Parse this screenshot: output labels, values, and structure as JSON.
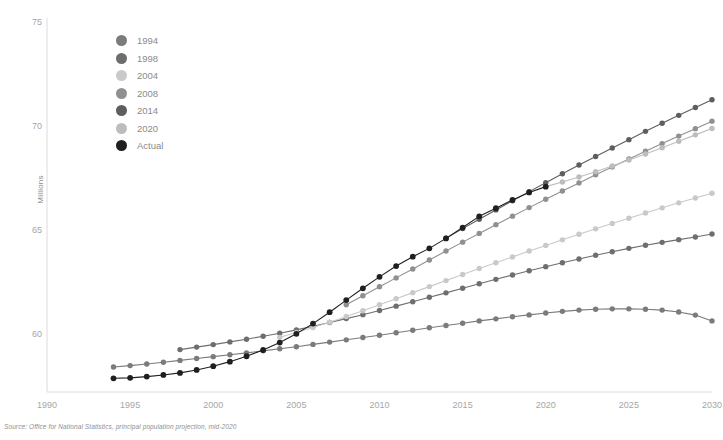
{
  "chart_data": {
    "type": "line",
    "title": "",
    "subtitle": "",
    "xlabel": "",
    "ylabel": "Millions",
    "xlim": [
      1990,
      2030
    ],
    "ylim": [
      57.2,
      75
    ],
    "grid": false,
    "legend_position": "top-left",
    "source_note": "Source: Office for National Statistics, principal population projection, mid-2020",
    "x_ticks": [
      1990,
      1995,
      2000,
      2005,
      2010,
      2015,
      2020,
      2025,
      2030
    ],
    "y_ticks": [
      60,
      65,
      70,
      75
    ],
    "series": [
      {
        "name": "1994",
        "color": "#7b7b7b",
        "x": [
          1994,
          1995,
          1996,
          1997,
          1998,
          1999,
          2000,
          2001,
          2002,
          2003,
          2004,
          2005,
          2006,
          2007,
          2008,
          2009,
          2010,
          2011,
          2012,
          2013,
          2014,
          2015,
          2016,
          2017,
          2018,
          2019,
          2020,
          2021,
          2022,
          2023,
          2024,
          2025,
          2026,
          2027,
          2028,
          2029,
          2030
        ],
        "values": [
          58.4,
          58.47,
          58.55,
          58.63,
          58.72,
          58.81,
          58.9,
          58.99,
          59.08,
          59.18,
          59.28,
          59.38,
          59.49,
          59.6,
          59.71,
          59.82,
          59.93,
          60.05,
          60.17,
          60.29,
          60.4,
          60.51,
          60.62,
          60.72,
          60.82,
          60.91,
          61.0,
          61.08,
          61.14,
          61.18,
          61.2,
          61.2,
          61.18,
          61.14,
          61.05,
          60.9,
          60.62
        ]
      },
      {
        "name": "1998",
        "color": "#6e6e6e",
        "x": [
          1998,
          1999,
          2000,
          2001,
          2002,
          2003,
          2004,
          2005,
          2006,
          2007,
          2008,
          2009,
          2010,
          2011,
          2012,
          2013,
          2014,
          2015,
          2016,
          2017,
          2018,
          2019,
          2020,
          2021,
          2022,
          2023,
          2024,
          2025,
          2026,
          2027,
          2028,
          2029,
          2030
        ],
        "values": [
          59.24,
          59.36,
          59.48,
          59.61,
          59.74,
          59.88,
          60.03,
          60.19,
          60.36,
          60.54,
          60.73,
          60.92,
          61.12,
          61.33,
          61.54,
          61.76,
          61.97,
          62.19,
          62.41,
          62.62,
          62.83,
          63.03,
          63.23,
          63.42,
          63.6,
          63.78,
          63.95,
          64.11,
          64.26,
          64.4,
          64.53,
          64.66,
          64.8
        ]
      },
      {
        "name": "2004",
        "color": "#c9c9c9",
        "x": [
          2004,
          2005,
          2006,
          2007,
          2008,
          2009,
          2010,
          2011,
          2012,
          2013,
          2014,
          2015,
          2016,
          2017,
          2018,
          2019,
          2020,
          2021,
          2022,
          2023,
          2024,
          2025,
          2026,
          2027,
          2028,
          2029,
          2030
        ],
        "values": [
          59.83,
          60.06,
          60.3,
          60.56,
          60.83,
          61.11,
          61.4,
          61.69,
          61.98,
          62.27,
          62.56,
          62.85,
          63.14,
          63.42,
          63.7,
          63.98,
          64.25,
          64.52,
          64.79,
          65.05,
          65.31,
          65.56,
          65.81,
          66.06,
          66.3,
          66.53,
          66.76
        ]
      },
      {
        "name": "2008",
        "color": "#909090",
        "x": [
          2008,
          2009,
          2010,
          2011,
          2012,
          2013,
          2014,
          2015,
          2016,
          2017,
          2018,
          2019,
          2020,
          2021,
          2022,
          2023,
          2024,
          2025,
          2026,
          2027,
          2028,
          2029,
          2030
        ],
        "values": [
          61.4,
          61.83,
          62.26,
          62.69,
          63.12,
          63.55,
          63.98,
          64.41,
          64.83,
          65.25,
          65.66,
          66.07,
          66.47,
          66.87,
          67.26,
          67.65,
          68.03,
          68.41,
          68.78,
          69.15,
          69.51,
          69.87,
          70.23
        ]
      },
      {
        "name": "2014",
        "color": "#5e5e5e",
        "x": [
          2014,
          2015,
          2016,
          2017,
          2018,
          2019,
          2020,
          2021,
          2022,
          2023,
          2024,
          2025,
          2026,
          2027,
          2028,
          2029,
          2030
        ],
        "values": [
          64.6,
          65.06,
          65.51,
          65.96,
          66.4,
          66.84,
          67.27,
          67.7,
          68.12,
          68.53,
          68.94,
          69.34,
          69.74,
          70.13,
          70.51,
          70.89,
          71.26
        ]
      },
      {
        "name": "2020",
        "color": "#bdbdbd",
        "x": [
          2020,
          2021,
          2022,
          2023,
          2024,
          2025,
          2026,
          2027,
          2028,
          2029,
          2030
        ],
        "values": [
          67.08,
          67.3,
          67.54,
          67.8,
          68.07,
          68.36,
          68.65,
          68.95,
          69.26,
          69.57,
          69.88
        ]
      },
      {
        "name": "Actual",
        "color": "#1f1f1f",
        "x": [
          1994,
          1995,
          1996,
          1997,
          1998,
          1999,
          2000,
          2001,
          2002,
          2003,
          2004,
          2005,
          2006,
          2007,
          2008,
          2009,
          2010,
          2011,
          2012,
          2013,
          2014,
          2015,
          2016,
          2017,
          2018,
          2019,
          2020
        ],
        "values": [
          57.86,
          57.88,
          57.94,
          58.02,
          58.12,
          58.26,
          58.44,
          58.66,
          58.92,
          59.22,
          59.58,
          60.0,
          60.49,
          61.04,
          61.62,
          62.19,
          62.74,
          63.26,
          63.71,
          64.11,
          64.59,
          65.11,
          65.65,
          66.04,
          66.44,
          66.8,
          67.08
        ]
      }
    ]
  },
  "legend": {
    "items": [
      {
        "label": "1994",
        "color": "#7b7b7b"
      },
      {
        "label": "1998",
        "color": "#6e6e6e"
      },
      {
        "label": "2004",
        "color": "#c9c9c9"
      },
      {
        "label": "2008",
        "color": "#909090"
      },
      {
        "label": "2014",
        "color": "#5e5e5e"
      },
      {
        "label": "2020",
        "color": "#bdbdbd"
      },
      {
        "label": "Actual",
        "color": "#1f1f1f"
      }
    ]
  },
  "axis": {
    "y_title": "Millions",
    "y_tick_labels": [
      "75",
      "70",
      "65",
      "60"
    ],
    "x_tick_labels": [
      "1990",
      "1995",
      "2000",
      "2005",
      "2010",
      "2015",
      "2020",
      "2025",
      "2030"
    ]
  },
  "footer": {
    "source": "Source: Office for National Statistics, principal population projection, mid-2020"
  },
  "colors": {
    "axis_line": "#dcdcdc",
    "tick_text": "#a6a6a6",
    "background": "#ffffff"
  }
}
